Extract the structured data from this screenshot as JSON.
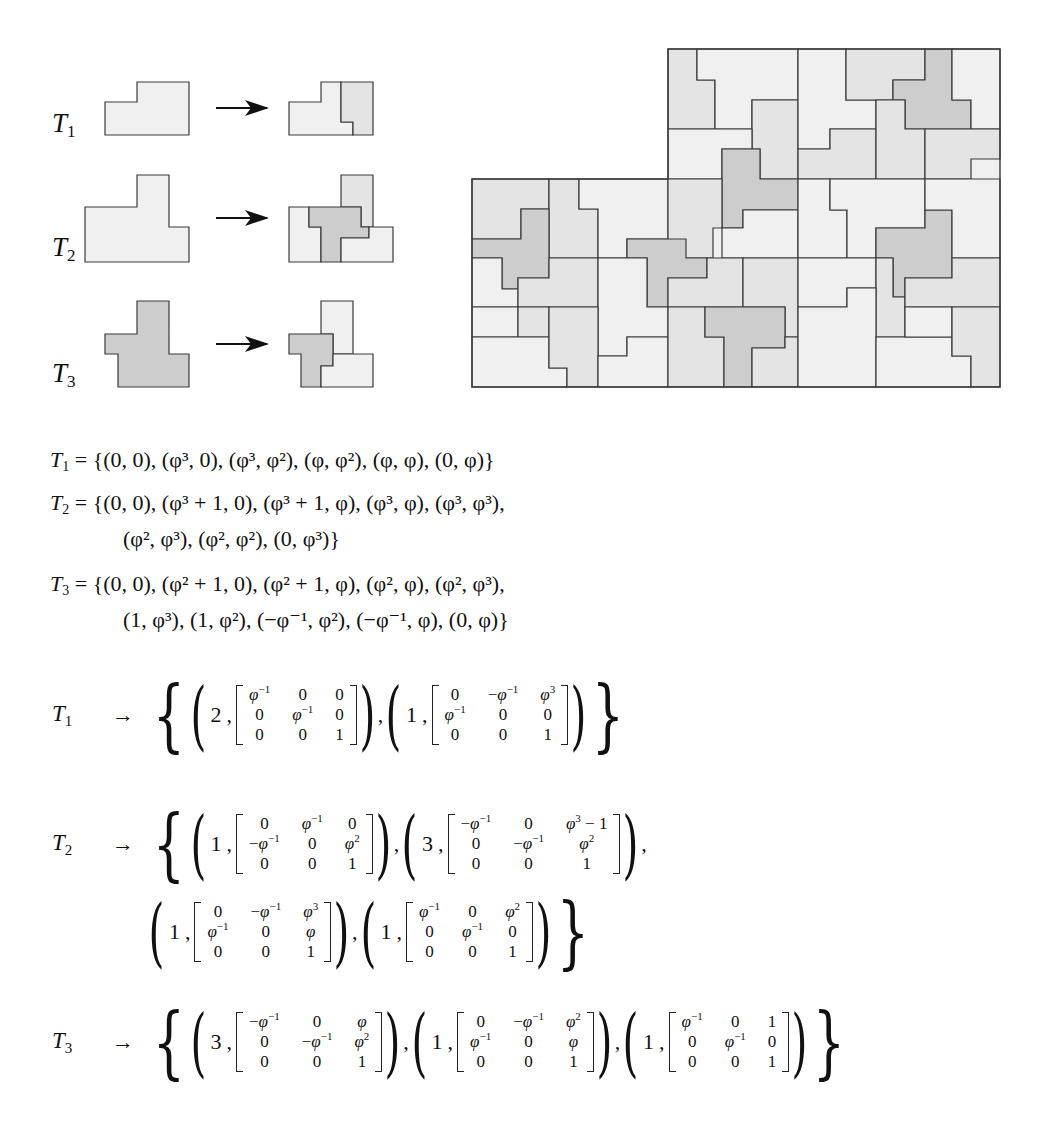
{
  "figure": {
    "colors": {
      "light": "#f0f0f0",
      "mid": "#e4e4e4",
      "dark": "#cdcdcd",
      "stroke": "#3a3a3a",
      "arrow": "#111111"
    },
    "labels": [
      {
        "name": "T",
        "sub": "1",
        "x": 52,
        "y": 112
      },
      {
        "name": "T",
        "sub": "2",
        "x": 52,
        "y": 236
      },
      {
        "name": "T",
        "sub": "3",
        "x": 52,
        "y": 362
      }
    ],
    "substitution_rules": [
      {
        "tile": "T1",
        "source": [
          {
            "fill": "light",
            "points": "105,135 189,135 189,82 137,82 137,102 105,102"
          }
        ],
        "result": [
          {
            "fill": "light",
            "points": "289,135 353,135 353,122 341,122 341,82 321,82 321,102 289,102"
          },
          {
            "fill": "mid",
            "points": "341,82 373,82 373,135 353,135 353,122 341,122"
          }
        ]
      },
      {
        "tile": "T2",
        "source": [
          {
            "fill": "light",
            "points": "85,262 189,262 189,227 169,227 169,175 137,175 137,207 85,207"
          }
        ],
        "result": [
          {
            "fill": "light",
            "points": "289,262 321,262 321,227 309,227 309,207 289,207"
          },
          {
            "fill": "mid",
            "points": "341,175 373,175 373,227 361,227 361,207 341,207"
          },
          {
            "fill": "dark",
            "points": "309,207 361,207 361,227 369,227 369,238 341,238 341,262 321,262 321,227 309,227"
          },
          {
            "fill": "light",
            "points": "341,262 393,262 393,227 369,227 369,238 341,238"
          }
        ]
      },
      {
        "tile": "T3",
        "source": [
          {
            "fill": "dark",
            "points": "118,387 189,387 189,354 169,354 169,301 137,301 137,334 105,334 105,354 118,354"
          }
        ],
        "result": [
          {
            "fill": "light",
            "points": "321,301 353,301 353,354 333,354 333,334 321,334"
          },
          {
            "fill": "dark",
            "points": "289,334 333,334 333,366 321,366 321,387 301,387 301,354 289,354"
          },
          {
            "fill": "light",
            "points": "321,387 373,387 373,354 333,354 333,366 321,366"
          }
        ]
      }
    ],
    "arrows": [
      {
        "x1": 216,
        "x2": 267,
        "y": 108
      },
      {
        "x1": 216,
        "x2": 267,
        "y": 218
      },
      {
        "x1": 216,
        "x2": 267,
        "y": 344
      }
    ],
    "tiling": {
      "outline": "472,387 1000,387 1000,49 668,49 668,179 472,179",
      "tiles": [
        {
          "fill": "mid",
          "points": "668,49 697,49 697,80 715,80 715,129 668,129"
        },
        {
          "fill": "light",
          "points": "697,49 798,49 798,100 752,100 752,129 715,129 715,80 697,80"
        },
        {
          "fill": "mid",
          "points": "752,100 798,100 798,179 760,179 760,149 752,149"
        },
        {
          "fill": "light",
          "points": "668,129 752,129 752,149 722,149 722,179 668,179"
        },
        {
          "fill": "dark",
          "points": "722,149 760,149 760,179 798,179 798,210 743,210 743,228 722,228"
        },
        {
          "fill": "light",
          "points": "798,49 846,49 846,100 876,100 876,129 830,129 830,149 798,149"
        },
        {
          "fill": "mid",
          "points": "846,49 925,49 925,80 893,80 893,100 846,100"
        },
        {
          "fill": "dark",
          "points": "925,49 952,49 952,100 971,100 971,129 905,129 905,100 893,100 893,80 925,80"
        },
        {
          "fill": "light",
          "points": "952,49 1000,49 1000,129 971,129 971,100 952,100"
        },
        {
          "fill": "mid",
          "points": "798,149 830,149 830,129 876,129 876,179 798,179"
        },
        {
          "fill": "mid",
          "points": "876,100 905,100 905,129 925,129 925,179 876,179"
        },
        {
          "fill": "mid",
          "points": "925,129 1000,129 1000,159 971,159 971,179 925,179"
        },
        {
          "fill": "mid",
          "points": "472,179 549,179 549,209 521,209 521,239 472,239"
        },
        {
          "fill": "mid",
          "points": "549,179 579,179 579,209 598,209 598,258 549,258"
        },
        {
          "fill": "light",
          "points": "579,179 668,179 668,239 627,239 627,258 598,258 598,209 579,209"
        },
        {
          "fill": "dark",
          "points": "472,239 521,239 521,209 549,209 549,278 518,278 518,289 502,289 502,258 472,258"
        },
        {
          "fill": "mid",
          "points": "668,179 722,179 722,228 713,228 713,258 668,258"
        },
        {
          "fill": "dark",
          "points": "627,239 686,239 686,258 707,258 707,278 668,278 668,307 647,307 647,258 627,258"
        },
        {
          "fill": "light",
          "points": "743,210 798,210 798,258 722,258 722,228 743,228"
        },
        {
          "fill": "light",
          "points": "798,179 830,179 830,210 847,210 847,258 798,258"
        },
        {
          "fill": "light",
          "points": "830,179 925,179 925,228 876,228 876,258 847,258 847,210 830,210"
        },
        {
          "fill": "dark",
          "points": "876,228 925,228 925,210 952,210 952,278 905,278 905,297 893,297 893,258 876,258"
        },
        {
          "fill": "light",
          "points": "925,179 1000,179 1000,258 952,258 952,210 925,210"
        },
        {
          "fill": "light",
          "points": "472,258 502,258 502,289 518,289 518,307 472,307"
        },
        {
          "fill": "mid",
          "points": "518,278 549,278 549,258 598,258 598,307 518,307"
        },
        {
          "fill": "light",
          "points": "598,258 647,258 647,307 668,307 668,337 627,337 627,356 598,356"
        },
        {
          "fill": "mid",
          "points": "668,278 707,278 707,258 743,258 743,307 668,307"
        },
        {
          "fill": "mid",
          "points": "743,258 798,258 798,337 785,337 785,307 743,307"
        },
        {
          "fill": "light",
          "points": "798,258 876,258 876,288 847,288 847,307 798,307"
        },
        {
          "fill": "mid",
          "points": "876,258 893,258 893,297 905,297 905,337 876,337"
        },
        {
          "fill": "mid",
          "points": "905,278 952,278 952,258 1000,258 1000,307 905,307"
        },
        {
          "fill": "light",
          "points": "472,307 518,307 518,337 472,337"
        },
        {
          "fill": "mid",
          "points": "518,307 549,307 549,337 518,337"
        },
        {
          "fill": "light",
          "points": "472,337 549,337 549,368 567,368 567,387 472,387"
        },
        {
          "fill": "mid",
          "points": "549,307 598,307 598,387 567,387 567,368 549,368"
        },
        {
          "fill": "light",
          "points": "598,356 627,356 627,337 668,337 668,387 598,387"
        },
        {
          "fill": "mid",
          "points": "668,307 705,307 705,337 724,337 724,387 668,387"
        },
        {
          "fill": "dark",
          "points": "705,307 785,307 785,337 785,337 785,348 752,348 752,387 724,387 724,337 705,337"
        },
        {
          "fill": "mid",
          "points": "752,348 785,348 785,337 798,337 798,387 752,387"
        },
        {
          "fill": "light",
          "points": "798,307 847,307 847,288 876,288 876,387 798,387"
        },
        {
          "fill": "light",
          "points": "876,337 952,337 952,356 971,356 971,387 876,387"
        },
        {
          "fill": "light",
          "points": "905,307 952,307 952,337 905,337"
        },
        {
          "fill": "mid",
          "points": "952,307 1000,307 1000,387 971,387 971,356 952,356"
        }
      ]
    }
  },
  "vertex_sets": [
    {
      "lhs": "T",
      "sub": "1",
      "lines": [
        "= {(0, 0), (φ³, 0), (φ³, φ²), (φ, φ²), (φ, φ), (0, φ)}"
      ]
    },
    {
      "lhs": "T",
      "sub": "2",
      "lines": [
        "= {(0, 0), (φ³ + 1, 0), (φ³ + 1, φ), (φ³, φ), (φ³, φ³),",
        "(φ², φ³), (φ², φ²), (0, φ³)}"
      ]
    },
    {
      "lhs": "T",
      "sub": "3",
      "lines": [
        "= {(0, 0), (φ² + 1, 0), (φ² + 1, φ), (φ², φ), (φ², φ³),",
        "(1, φ³), (1, φ²), (−φ⁻¹, φ²), (−φ⁻¹, φ), (0, φ)}"
      ]
    }
  ],
  "rules": {
    "arrow": "→",
    "T1": {
      "label": "T",
      "sub": "1",
      "terms": [
        {
          "count": "2",
          "matrix": [
            [
              "φ⁻¹",
              "0",
              "0"
            ],
            [
              "0",
              "φ⁻¹",
              "0"
            ],
            [
              "0",
              "0",
              "1"
            ]
          ]
        },
        {
          "count": "1",
          "matrix": [
            [
              "0",
              "−φ⁻¹",
              "φ³"
            ],
            [
              "φ⁻¹",
              "0",
              "0"
            ],
            [
              "0",
              "0",
              "1"
            ]
          ]
        }
      ]
    },
    "T2": {
      "label": "T",
      "sub": "2",
      "terms": [
        {
          "count": "1",
          "matrix": [
            [
              "0",
              "φ⁻¹",
              "0"
            ],
            [
              "−φ⁻¹",
              "0",
              "φ²"
            ],
            [
              "0",
              "0",
              "1"
            ]
          ]
        },
        {
          "count": "3",
          "matrix": [
            [
              "−φ⁻¹",
              "0",
              "φ³ − 1"
            ],
            [
              "0",
              "−φ⁻¹",
              "φ²"
            ],
            [
              "0",
              "0",
              "1"
            ]
          ]
        },
        {
          "count": "1",
          "matrix": [
            [
              "0",
              "−φ⁻¹",
              "φ³"
            ],
            [
              "φ⁻¹",
              "0",
              "φ"
            ],
            [
              "0",
              "0",
              "1"
            ]
          ]
        },
        {
          "count": "1",
          "matrix": [
            [
              "φ⁻¹",
              "0",
              "φ²"
            ],
            [
              "0",
              "φ⁻¹",
              "0"
            ],
            [
              "0",
              "0",
              "1"
            ]
          ]
        }
      ]
    },
    "T3": {
      "label": "T",
      "sub": "3",
      "terms": [
        {
          "count": "3",
          "matrix": [
            [
              "−φ⁻¹",
              "0",
              "φ"
            ],
            [
              "0",
              "−φ⁻¹",
              "φ²"
            ],
            [
              "0",
              "0",
              "1"
            ]
          ]
        },
        {
          "count": "1",
          "matrix": [
            [
              "0",
              "−φ⁻¹",
              "φ²"
            ],
            [
              "φ⁻¹",
              "0",
              "φ"
            ],
            [
              "0",
              "0",
              "1"
            ]
          ]
        },
        {
          "count": "1",
          "matrix": [
            [
              "φ⁻¹",
              "0",
              "1"
            ],
            [
              "0",
              "φ⁻¹",
              "0"
            ],
            [
              "0",
              "0",
              "1"
            ]
          ]
        }
      ]
    }
  },
  "punct": {
    "lbrace": "{",
    "rbrace": "}",
    "lparen": "(",
    "rparen": ")",
    "comma": ","
  }
}
